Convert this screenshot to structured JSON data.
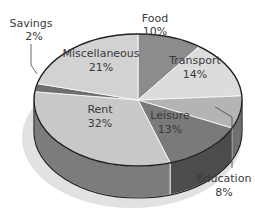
{
  "chart_data": {
    "type": "pie",
    "title": "",
    "style": "3d-grayscale",
    "slices": [
      {
        "label": "Food",
        "value": 10,
        "value_label": "10%",
        "color": "#8c8c8c"
      },
      {
        "label": "Transport",
        "value": 14,
        "value_label": "14%",
        "color": "#dcdcdc"
      },
      {
        "label": "Education",
        "value": 8,
        "value_label": "8%",
        "color": "#b4b4b4"
      },
      {
        "label": "Leisure",
        "value": 13,
        "value_label": "13%",
        "color": "#7a7a7a"
      },
      {
        "label": "Rent",
        "value": 32,
        "value_label": "32%",
        "color": "#c8c8c8"
      },
      {
        "label": "Savings",
        "value": 2,
        "value_label": "2%",
        "color": "#6e6e6e"
      },
      {
        "label": "Miscellaneous",
        "value": 21,
        "value_label": "21%",
        "color": "#d2d2d2"
      }
    ],
    "start_position": "top",
    "direction": "clockwise",
    "legend": "none"
  }
}
